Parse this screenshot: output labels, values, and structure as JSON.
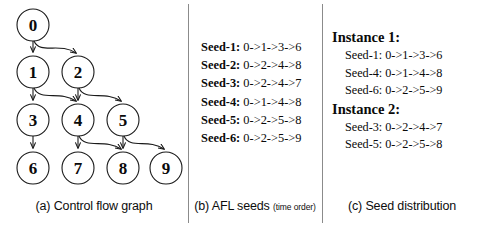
{
  "figure": {
    "panels": [
      {
        "id": "a",
        "caption": "(a) Control flow graph",
        "caption_sub": ""
      },
      {
        "id": "b",
        "caption": "(b) AFL seeds ",
        "caption_sub": "(time order)"
      },
      {
        "id": "c",
        "caption": "(c) Seed distribution",
        "caption_sub": ""
      }
    ]
  },
  "cfg": {
    "nodes": [
      {
        "id": "0",
        "label": "0",
        "cx": 33,
        "cy": 25
      },
      {
        "id": "1",
        "label": "1",
        "cx": 33,
        "cy": 72
      },
      {
        "id": "2",
        "label": "2",
        "cx": 78,
        "cy": 72
      },
      {
        "id": "3",
        "label": "3",
        "cx": 33,
        "cy": 120
      },
      {
        "id": "4",
        "label": "4",
        "cx": 78,
        "cy": 120
      },
      {
        "id": "5",
        "label": "5",
        "cx": 123,
        "cy": 120
      },
      {
        "id": "6",
        "label": "6",
        "cx": 33,
        "cy": 168
      },
      {
        "id": "7",
        "label": "7",
        "cx": 78,
        "cy": 168
      },
      {
        "id": "8",
        "label": "8",
        "cx": 123,
        "cy": 168
      },
      {
        "id": "9",
        "label": "9",
        "cx": 166,
        "cy": 168
      }
    ],
    "node_radius": 16,
    "edges": [
      {
        "from": "0",
        "to": "1"
      },
      {
        "from": "0",
        "to": "2"
      },
      {
        "from": "1",
        "to": "3"
      },
      {
        "from": "1",
        "to": "4"
      },
      {
        "from": "2",
        "to": "4"
      },
      {
        "from": "2",
        "to": "5"
      },
      {
        "from": "3",
        "to": "6"
      },
      {
        "from": "4",
        "to": "7"
      },
      {
        "from": "4",
        "to": "8"
      },
      {
        "from": "5",
        "to": "8"
      },
      {
        "from": "5",
        "to": "9"
      }
    ]
  },
  "seeds": {
    "items": [
      {
        "label": "Seed-1:",
        "path": " 0->1->3->6"
      },
      {
        "label": "Seed-2:",
        "path": " 0->2->4->8"
      },
      {
        "label": "Seed-3:",
        "path": " 0->2->4->7"
      },
      {
        "label": "Seed-4:",
        "path": " 0->1->4->8"
      },
      {
        "label": "Seed-5:",
        "path": " 0->2->5->8"
      },
      {
        "label": "Seed-6:",
        "path": " 0->2->5->9"
      }
    ]
  },
  "distribution": {
    "groups": [
      {
        "title": "Instance 1:",
        "seeds": [
          "Seed-1: 0->1->3->6",
          "Seed-4: 0->1->4->8",
          "Seed-6: 0->2->5->9"
        ]
      },
      {
        "title": "Instance 2:",
        "seeds": [
          "Seed-3: 0->2->4->7",
          "Seed-5: 0->2->5->8"
        ]
      }
    ]
  },
  "colors": {
    "stroke": "#1a1a1a",
    "divider": "#8b8b8b",
    "background": "#ffffff"
  }
}
